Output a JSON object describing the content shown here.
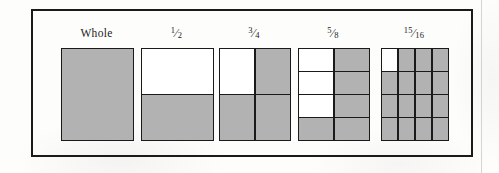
{
  "figure": {
    "name": "fraction-bar-diagram",
    "border_color": "#1a1a1a",
    "shaded_color": "#b2b2b2",
    "unshaded_color": "#ffffff",
    "background_color": "#fdfdfc"
  },
  "units": [
    {
      "id": "whole",
      "label": "Whole",
      "label_kind": "word",
      "numerator": 1,
      "denominator": 1,
      "cols": 1,
      "rows": 1,
      "shaded_count": 1,
      "shaded_cells": [
        1
      ],
      "x": 61,
      "y": 48,
      "width": 71,
      "height": 91
    },
    {
      "id": "one-half",
      "label": "1/2",
      "label_kind": "fraction",
      "numerator": 1,
      "denominator": 2,
      "cols": 1,
      "rows": 2,
      "shaded_count": 1,
      "shaded_cells": [
        0,
        1
      ],
      "x": 141,
      "y": 48,
      "width": 71,
      "height": 91
    },
    {
      "id": "three-quarters",
      "label": "3/4",
      "label_kind": "fraction",
      "numerator": 3,
      "denominator": 4,
      "cols": 2,
      "rows": 2,
      "shaded_count": 3,
      "shaded_cells": [
        0,
        1,
        1,
        1
      ],
      "x": 219,
      "y": 48,
      "width": 70,
      "height": 91
    },
    {
      "id": "five-eighths",
      "label": "5/8",
      "label_kind": "fraction",
      "numerator": 5,
      "denominator": 8,
      "cols": 2,
      "rows": 4,
      "shaded_count": 5,
      "shaded_cells": [
        0,
        1,
        0,
        1,
        0,
        1,
        1,
        1
      ],
      "x": 298,
      "y": 48,
      "width": 70,
      "height": 91
    },
    {
      "id": "fifteen-sixteenths",
      "label": "15/16",
      "label_kind": "fraction",
      "numerator": 15,
      "denominator": 16,
      "cols": 4,
      "rows": 4,
      "shaded_count": 15,
      "shaded_cells": [
        0,
        1,
        1,
        1,
        1,
        1,
        1,
        1,
        1,
        1,
        1,
        1,
        1,
        1,
        1,
        1
      ],
      "x": 381,
      "y": 48,
      "width": 66,
      "height": 91
    }
  ]
}
